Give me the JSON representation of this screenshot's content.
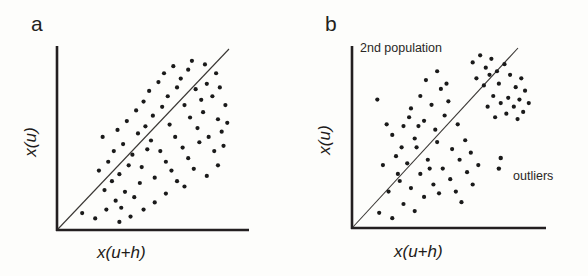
{
  "figure": {
    "background_color": "#fdfdfb",
    "ink_color": "#231f20",
    "panels": [
      {
        "id": "a",
        "label": "a",
        "axis_label_y": "x(u)",
        "axis_label_x": "x(u+h)",
        "annotations": []
      },
      {
        "id": "b",
        "label": "b",
        "axis_label_y": "x(u)",
        "axis_label_x": "x(u+h)",
        "annotations": [
          "2nd population",
          "outliers"
        ]
      }
    ]
  },
  "chart_data": [
    {
      "type": "scatter",
      "panel": "a",
      "title": "a",
      "xlabel": "x(u+h)",
      "ylabel": "x(u)",
      "xlim": [
        0,
        100
      ],
      "ylim": [
        0,
        100
      ],
      "grid": false,
      "legend": "none",
      "axes_style": "L-shaped spines, no tick marks, no tick labels",
      "reference_line": {
        "name": "45-degree-line",
        "description": "y = x diagonal from origin",
        "x": [
          0,
          92
        ],
        "y": [
          0,
          92
        ]
      },
      "series": [
        {
          "name": "main population",
          "marker": "filled circle",
          "points": [
            [
              13,
              9
            ],
            [
              20,
              6
            ],
            [
              26,
              11
            ],
            [
              31,
              16
            ],
            [
              34,
              12
            ],
            [
              25,
              22
            ],
            [
              29,
              27
            ],
            [
              36,
              21
            ],
            [
              41,
              18
            ],
            [
              44,
              26
            ],
            [
              22,
              33
            ],
            [
              27,
              38
            ],
            [
              33,
              31
            ],
            [
              38,
              36
            ],
            [
              30,
              44
            ],
            [
              35,
              48
            ],
            [
              40,
              42
            ],
            [
              45,
              35
            ],
            [
              48,
              45
            ],
            [
              52,
              29
            ],
            [
              24,
              52
            ],
            [
              32,
              56
            ],
            [
              37,
              61
            ],
            [
              43,
              54
            ],
            [
              47,
              58
            ],
            [
              50,
              50
            ],
            [
              55,
              44
            ],
            [
              58,
              38
            ],
            [
              61,
              33
            ],
            [
              64,
              27
            ],
            [
              42,
              67
            ],
            [
              46,
              72
            ],
            [
              51,
              64
            ],
            [
              56,
              69
            ],
            [
              60,
              59
            ],
            [
              63,
              52
            ],
            [
              67,
              46
            ],
            [
              70,
              40
            ],
            [
              73,
              34
            ],
            [
              76,
              49
            ],
            [
              49,
              78
            ],
            [
              54,
              83
            ],
            [
              59,
              75
            ],
            [
              64,
              80
            ],
            [
              68,
              70
            ],
            [
              71,
              63
            ],
            [
              75,
              57
            ],
            [
              78,
              66
            ],
            [
              81,
              52
            ],
            [
              84,
              44
            ],
            [
              57,
              88
            ],
            [
              62,
              92
            ],
            [
              66,
              85
            ],
            [
              70,
              90
            ],
            [
              74,
              79
            ],
            [
              77,
              73
            ],
            [
              80,
              82
            ],
            [
              83,
              75
            ],
            [
              86,
              62
            ],
            [
              88,
              55
            ],
            [
              72,
              95
            ],
            [
              79,
              93
            ],
            [
              85,
              88
            ],
            [
              87,
              80
            ],
            [
              90,
              70
            ],
            [
              91,
              60
            ],
            [
              89,
              47
            ],
            [
              86,
              36
            ],
            [
              80,
              30
            ],
            [
              68,
              24
            ],
            [
              58,
              20
            ],
            [
              52,
              15
            ],
            [
              46,
              11
            ],
            [
              39,
              7
            ],
            [
              33,
              4
            ]
          ]
        }
      ]
    },
    {
      "type": "scatter",
      "panel": "b",
      "title": "b",
      "xlabel": "x(u+h)",
      "ylabel": "x(u)",
      "xlim": [
        0,
        100
      ],
      "ylim": [
        0,
        100
      ],
      "grid": false,
      "legend": "none",
      "axes_style": "L-shaped spines, no tick marks, no tick labels",
      "reference_line": {
        "name": "45-degree-line",
        "description": "y = x diagonal from origin",
        "x": [
          0,
          92
        ],
        "y": [
          0,
          92
        ]
      },
      "series": [
        {
          "name": "main population",
          "marker": "filled circle",
          "points": [
            [
              14,
              8
            ],
            [
              21,
              5
            ],
            [
              27,
              13
            ],
            [
              33,
              9
            ],
            [
              38,
              17
            ],
            [
              19,
              20
            ],
            [
              25,
              26
            ],
            [
              31,
              22
            ],
            [
              36,
              30
            ],
            [
              43,
              24
            ],
            [
              16,
              35
            ],
            [
              23,
              40
            ],
            [
              29,
              36
            ],
            [
              34,
              45
            ],
            [
              40,
              38
            ],
            [
              45,
              48
            ],
            [
              48,
              33
            ],
            [
              52,
              27
            ],
            [
              55,
              20
            ],
            [
              58,
              14
            ],
            [
              21,
              52
            ],
            [
              27,
              57
            ],
            [
              33,
              50
            ],
            [
              38,
              60
            ],
            [
              44,
              55
            ],
            [
              49,
              63
            ],
            [
              53,
              44
            ],
            [
              57,
              38
            ],
            [
              61,
              31
            ],
            [
              64,
              24
            ],
            [
              13,
              72
            ],
            [
              31,
              67
            ],
            [
              36,
              74
            ],
            [
              42,
              69
            ],
            [
              47,
              78
            ],
            [
              51,
              71
            ],
            [
              56,
              58
            ],
            [
              60,
              49
            ],
            [
              63,
              42
            ],
            [
              67,
              35
            ],
            [
              39,
              83
            ],
            [
              45,
              88
            ],
            [
              50,
              81
            ],
            [
              30,
              62
            ],
            [
              26,
              45
            ],
            [
              35,
              57
            ],
            [
              41,
              33
            ],
            [
              46,
              19
            ],
            [
              24,
              30
            ],
            [
              18,
              58
            ]
          ]
        },
        {
          "name": "2nd population",
          "marker": "filled circle",
          "annotation": "2nd population",
          "points": [
            [
              64,
              93
            ],
            [
              68,
              97
            ],
            [
              71,
              90
            ],
            [
              74,
              95
            ],
            [
              77,
              88
            ],
            [
              66,
              84
            ],
            [
              70,
              80
            ],
            [
              73,
              86
            ],
            [
              78,
              81
            ],
            [
              81,
              92
            ],
            [
              84,
              86
            ],
            [
              87,
              79
            ],
            [
              90,
              84
            ],
            [
              83,
              73
            ],
            [
              86,
              68
            ],
            [
              89,
              72
            ],
            [
              92,
              77
            ],
            [
              75,
              74
            ],
            [
              79,
              70
            ],
            [
              72,
              68
            ],
            [
              91,
              65
            ],
            [
              94,
              70
            ],
            [
              88,
              61
            ],
            [
              82,
              64
            ],
            [
              76,
              62
            ]
          ]
        },
        {
          "name": "outliers",
          "marker": "filled circle",
          "annotation": "outliers",
          "points": [
            [
              79,
              39
            ],
            [
              78,
              33
            ]
          ]
        }
      ]
    }
  ]
}
